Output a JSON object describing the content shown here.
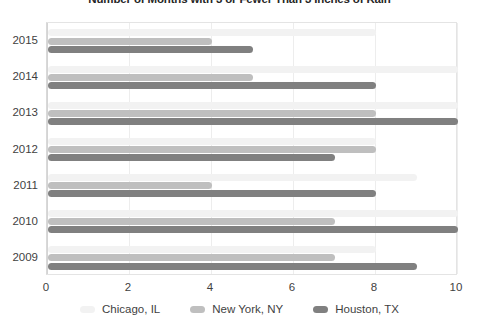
{
  "chart_data": {
    "type": "bar",
    "orientation": "horizontal",
    "title": "Number of Months with 3 or Fewer Than 3 Inches of Rain",
    "xlabel": "",
    "ylabel": "",
    "categories": [
      "2009",
      "2010",
      "2011",
      "2012",
      "2013",
      "2014",
      "2015"
    ],
    "category_order_top_to_bottom": [
      "2015",
      "2014",
      "2013",
      "2012",
      "2011",
      "2010",
      "2009"
    ],
    "series": [
      {
        "name": "Chicago, IL",
        "color": "#f2f2f2",
        "values": [
          8,
          10,
          9,
          8,
          10,
          10,
          8
        ]
      },
      {
        "name": "New York, NY",
        "color": "#bfbfbf",
        "values": [
          7,
          7,
          4,
          8,
          8,
          5,
          4
        ]
      },
      {
        "name": "Houston, TX",
        "color": "#808080",
        "values": [
          9,
          10,
          8,
          7,
          10,
          8,
          5
        ]
      }
    ],
    "xlim": [
      0,
      10
    ],
    "xticks": [
      0,
      2,
      4,
      6,
      8,
      10
    ],
    "xtick_labels": [
      "0",
      "2",
      "4",
      "6",
      "8",
      "10"
    ],
    "grid": true,
    "grid_axis": "x",
    "legend_position": "bottom"
  },
  "legend": {
    "items": [
      {
        "label": "Chicago, IL"
      },
      {
        "label": "New York, NY"
      },
      {
        "label": "Houston, TX"
      }
    ]
  }
}
